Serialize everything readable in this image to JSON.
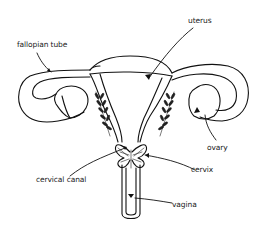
{
  "diagram": {
    "title": "",
    "style": "hand-drawn line illustration",
    "colors": {
      "background": "#ffffff",
      "ink": "#111111"
    },
    "labels": {
      "fallopian_tube": "fallopian tube",
      "uterus": "uterus",
      "ovary": "ovary",
      "cervix": "cervix",
      "cervical_canal": "cervical canal",
      "vagina": "vagina"
    },
    "parts": [
      {
        "id": "fallopian-tube",
        "label": "fallopian tube",
        "side": "left"
      },
      {
        "id": "uterus",
        "label": "uterus",
        "position": "center-top"
      },
      {
        "id": "ovary",
        "label": "ovary",
        "side": "right"
      },
      {
        "id": "cervix",
        "label": "cervix",
        "position": "center"
      },
      {
        "id": "cervical-canal",
        "label": "cervical canal",
        "position": "center"
      },
      {
        "id": "vagina",
        "label": "vagina",
        "position": "center-bottom"
      }
    ]
  }
}
